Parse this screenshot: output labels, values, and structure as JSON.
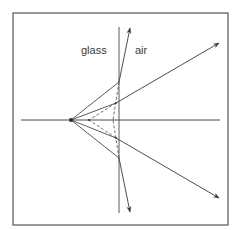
{
  "diagram": {
    "labels": {
      "left_medium": "glass",
      "right_medium": "air"
    },
    "colors": {
      "line": "#4a4a4a",
      "frame": "#555555",
      "background": "#ffffff"
    },
    "frame": {
      "x": 13,
      "y": 13,
      "width": 215,
      "height": 212
    },
    "interface_line": {
      "x": 119,
      "y1": 27,
      "y2": 213
    },
    "optical_axis": {
      "y": 120,
      "x1": 21,
      "x2": 220
    },
    "source_point": {
      "x": 71,
      "y": 120
    },
    "virtual_image_point": {
      "x": 89,
      "y": 120
    },
    "rays": [
      {
        "name": "steep-upper",
        "incident": [
          [
            71,
            120
          ],
          [
            119,
            82
          ]
        ],
        "refracted": [
          [
            119,
            82
          ],
          [
            130,
            28
          ]
        ]
      },
      {
        "name": "shallow-upper",
        "incident": [
          [
            71,
            120
          ],
          [
            116,
            103
          ]
        ],
        "refracted": [
          [
            116,
            103
          ],
          [
            219,
            43
          ]
        ]
      },
      {
        "name": "shallow-lower",
        "incident": [
          [
            71,
            120
          ],
          [
            116,
            138
          ]
        ],
        "refracted": [
          [
            116,
            138
          ],
          [
            219,
            198
          ]
        ]
      },
      {
        "name": "steep-lower",
        "incident": [
          [
            71,
            120
          ],
          [
            119,
            158
          ]
        ],
        "refracted": [
          [
            119,
            158
          ],
          [
            130,
            212
          ]
        ]
      }
    ],
    "dashed_extensions": [
      [
        [
          119,
          82
        ],
        [
          113,
          120
        ]
      ],
      [
        [
          119,
          158
        ],
        [
          113,
          120
        ]
      ],
      [
        [
          116,
          103
        ],
        [
          89,
          120
        ]
      ],
      [
        [
          116,
          138
        ],
        [
          89,
          120
        ]
      ]
    ]
  }
}
